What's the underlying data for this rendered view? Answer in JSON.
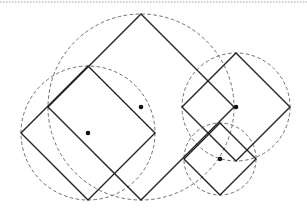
{
  "diagram": {
    "title": "",
    "colors": {
      "background": "#ffffff",
      "square_stroke": "#222222",
      "circle_stroke": "#6e6e6e",
      "dot": "#111111",
      "top_rule": "#9a9a9a"
    },
    "top_rule": {
      "y": 2,
      "x1": 0,
      "x2": 307
    },
    "shapes": [
      {
        "id": "large",
        "center": [
          141,
          107
        ],
        "half_diagonal": 93,
        "circle_radius": 93
      },
      {
        "id": "left",
        "center": [
          88,
          133
        ],
        "half_diagonal": 67,
        "circle_radius": 67
      },
      {
        "id": "right",
        "center": [
          236,
          107
        ],
        "half_diagonal": 54,
        "circle_radius": 54
      },
      {
        "id": "small",
        "center": [
          220,
          159
        ],
        "half_diagonal": 36,
        "circle_radius": 36
      }
    ]
  }
}
